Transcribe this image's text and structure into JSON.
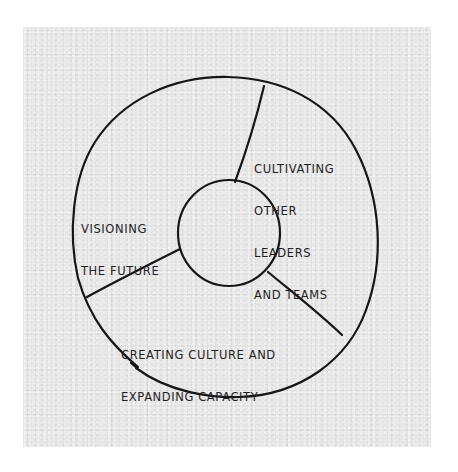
{
  "diagram": {
    "type": "hand-drawn ring diagram with three segments around a central circle",
    "background_color": "#e6e6e6",
    "ink_color": "#161616",
    "segments": [
      {
        "id": "cultivating",
        "lines": [
          "CULTIVATING",
          "OTHER",
          "LEADERS",
          "AND TEAMS"
        ]
      },
      {
        "id": "visioning",
        "lines": [
          "VISIONING",
          "THE FUTURE"
        ]
      },
      {
        "id": "creating",
        "lines": [
          "CREATING CULTURE AND",
          "EXPANDING CAPACITY"
        ]
      }
    ],
    "center_label": ""
  }
}
